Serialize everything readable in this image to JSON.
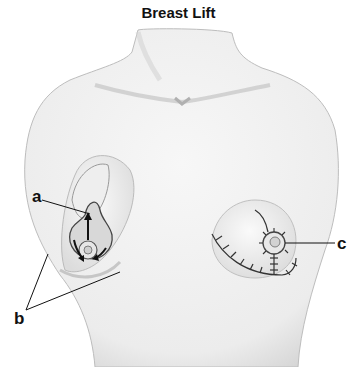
{
  "title": "Breast Lift",
  "labels": {
    "a": "a",
    "b": "b",
    "c": "c"
  },
  "colors": {
    "skin": "#f2f2f2",
    "shade": "#c8c8c8",
    "line": "#222222",
    "background": "#ffffff"
  }
}
